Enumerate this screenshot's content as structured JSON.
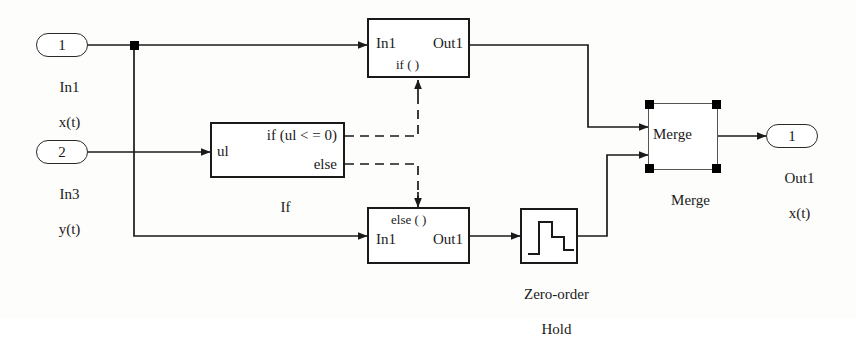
{
  "diagram": {
    "colors": {
      "line": "#1a1a1a",
      "block_fill": "#ffffff",
      "handle": "#000000",
      "background": "#fdfdfc"
    }
  },
  "ports": {
    "input1": {
      "number": "1",
      "name": "In1",
      "signal": "x(t)"
    },
    "input2": {
      "number": "2",
      "name": "In3",
      "signal": "y(t)"
    },
    "output1": {
      "number": "1",
      "name": "Out1",
      "signal": "x(t)"
    }
  },
  "blocks": {
    "if_block": {
      "label": "If",
      "input_label": "ul",
      "condition": "if (ul < = 0)",
      "else_label": "else"
    },
    "if_action_subsystem": {
      "inport": "In1",
      "outport": "Out1",
      "tag": "if ( )"
    },
    "else_action_subsystem": {
      "tag": "else ( )",
      "inport": "In1",
      "outport": "Out1"
    },
    "zero_order_hold": {
      "label_line1": "Zero-order",
      "label_line2": "Hold",
      "icon": "staircase-icon"
    },
    "merge_block": {
      "text": "Merge",
      "label": "Merge",
      "selected": true,
      "handle_count": 4
    }
  },
  "icons": {
    "arrow": "arrowhead-icon",
    "junction": "signal-junction-dot-icon"
  }
}
